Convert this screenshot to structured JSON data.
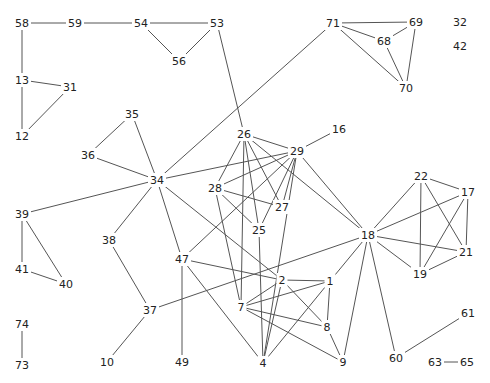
{
  "diagram": {
    "type": "undirected-graph",
    "nodes": [
      {
        "id": "58"
      },
      {
        "id": "59"
      },
      {
        "id": "54"
      },
      {
        "id": "53"
      },
      {
        "id": "56"
      },
      {
        "id": "13"
      },
      {
        "id": "31"
      },
      {
        "id": "12"
      },
      {
        "id": "35"
      },
      {
        "id": "36"
      },
      {
        "id": "34"
      },
      {
        "id": "71"
      },
      {
        "id": "69"
      },
      {
        "id": "68"
      },
      {
        "id": "70"
      },
      {
        "id": "32"
      },
      {
        "id": "42"
      },
      {
        "id": "16"
      },
      {
        "id": "26"
      },
      {
        "id": "29"
      },
      {
        "id": "28"
      },
      {
        "id": "27"
      },
      {
        "id": "25"
      },
      {
        "id": "39"
      },
      {
        "id": "41"
      },
      {
        "id": "40"
      },
      {
        "id": "38"
      },
      {
        "id": "47"
      },
      {
        "id": "2"
      },
      {
        "id": "1"
      },
      {
        "id": "7"
      },
      {
        "id": "8"
      },
      {
        "id": "4"
      },
      {
        "id": "9"
      },
      {
        "id": "37"
      },
      {
        "id": "10"
      },
      {
        "id": "49"
      },
      {
        "id": "18"
      },
      {
        "id": "22"
      },
      {
        "id": "17"
      },
      {
        "id": "21"
      },
      {
        "id": "19"
      },
      {
        "id": "61"
      },
      {
        "id": "60"
      },
      {
        "id": "63"
      },
      {
        "id": "65"
      },
      {
        "id": "74"
      },
      {
        "id": "73"
      }
    ],
    "edges": [
      [
        "58",
        "59"
      ],
      [
        "59",
        "54"
      ],
      [
        "54",
        "53"
      ],
      [
        "54",
        "56"
      ],
      [
        "53",
        "56"
      ],
      [
        "53",
        "26"
      ],
      [
        "58",
        "13"
      ],
      [
        "13",
        "12"
      ],
      [
        "13",
        "31"
      ],
      [
        "31",
        "12"
      ],
      [
        "71",
        "69"
      ],
      [
        "71",
        "68"
      ],
      [
        "71",
        "70"
      ],
      [
        "68",
        "69"
      ],
      [
        "68",
        "70"
      ],
      [
        "69",
        "70"
      ],
      [
        "71",
        "34"
      ],
      [
        "35",
        "36"
      ],
      [
        "35",
        "34"
      ],
      [
        "36",
        "34"
      ],
      [
        "34",
        "39"
      ],
      [
        "34",
        "38"
      ],
      [
        "34",
        "47"
      ],
      [
        "34",
        "2"
      ],
      [
        "34",
        "29"
      ],
      [
        "39",
        "41"
      ],
      [
        "39",
        "40"
      ],
      [
        "41",
        "40"
      ],
      [
        "38",
        "37"
      ],
      [
        "37",
        "10"
      ],
      [
        "37",
        "18"
      ],
      [
        "47",
        "49"
      ],
      [
        "47",
        "29"
      ],
      [
        "47",
        "2"
      ],
      [
        "47",
        "4"
      ],
      [
        "16",
        "29"
      ],
      [
        "26",
        "29"
      ],
      [
        "26",
        "28"
      ],
      [
        "26",
        "27"
      ],
      [
        "26",
        "25"
      ],
      [
        "26",
        "7"
      ],
      [
        "26",
        "18"
      ],
      [
        "29",
        "28"
      ],
      [
        "29",
        "27"
      ],
      [
        "29",
        "25"
      ],
      [
        "29",
        "18"
      ],
      [
        "29",
        "4"
      ],
      [
        "28",
        "27"
      ],
      [
        "28",
        "25"
      ],
      [
        "28",
        "7"
      ],
      [
        "25",
        "4"
      ],
      [
        "2",
        "1"
      ],
      [
        "2",
        "7"
      ],
      [
        "2",
        "8"
      ],
      [
        "2",
        "4"
      ],
      [
        "1",
        "7"
      ],
      [
        "1",
        "8"
      ],
      [
        "1",
        "4"
      ],
      [
        "1",
        "18"
      ],
      [
        "7",
        "8"
      ],
      [
        "7",
        "9"
      ],
      [
        "8",
        "9"
      ],
      [
        "18",
        "9"
      ],
      [
        "18",
        "60"
      ],
      [
        "18",
        "22"
      ],
      [
        "18",
        "17"
      ],
      [
        "18",
        "21"
      ],
      [
        "18",
        "19"
      ],
      [
        "22",
        "17"
      ],
      [
        "22",
        "19"
      ],
      [
        "22",
        "21"
      ],
      [
        "17",
        "21"
      ],
      [
        "17",
        "19"
      ],
      [
        "21",
        "19"
      ],
      [
        "60",
        "61"
      ],
      [
        "63",
        "65"
      ],
      [
        "74",
        "73"
      ]
    ]
  }
}
